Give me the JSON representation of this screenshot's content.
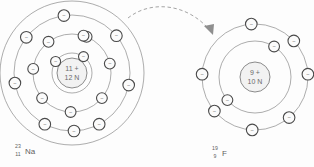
{
  "diagram": {
    "background_color": "#fdfdfd",
    "line_color": "#8a8a8a",
    "electron_stroke_color": "#4a4a4a",
    "text_color": "#5f5f5f"
  },
  "atoms": [
    {
      "id": "sodium",
      "element_symbol": "Na",
      "element_name": "Sodium",
      "mass_number": "23",
      "atomic_number": "11",
      "nucleus_protons_label": "11 +",
      "nucleus_neutrons_label": "12 N",
      "center": {
        "x": 72,
        "y": 73
      },
      "shell_radii": [
        20,
        39,
        58,
        72
      ],
      "shell_electron_counts": [
        2,
        8,
        1
      ],
      "electron_symbol": "–",
      "electrons": [
        {
          "shell": 1,
          "angle": -55,
          "radius": 20
        },
        {
          "shell": 1,
          "angle": 145,
          "radius": 20
        },
        {
          "shell": 2,
          "angle": -68,
          "radius": 39
        },
        {
          "shell": 2,
          "angle": -14,
          "radius": 39
        },
        {
          "shell": 2,
          "angle": 40,
          "radius": 39
        },
        {
          "shell": 2,
          "angle": 92,
          "radius": 39
        },
        {
          "shell": 2,
          "angle": 140,
          "radius": 39
        },
        {
          "shell": 2,
          "angle": 186,
          "radius": 39
        },
        {
          "shell": 2,
          "angle": 233,
          "radius": 39
        },
        {
          "shell": 2,
          "angle": 287,
          "radius": 39
        },
        {
          "shell": 3,
          "angle": -98,
          "radius": 58
        },
        {
          "shell": 3,
          "angle": -40,
          "radius": 58
        },
        {
          "shell": 3,
          "angle": 12,
          "radius": 58
        },
        {
          "shell": 3,
          "angle": 62,
          "radius": 58
        },
        {
          "shell": 3,
          "angle": 118,
          "radius": 58
        },
        {
          "shell": 3,
          "angle": 170,
          "radius": 58
        },
        {
          "shell": 3,
          "angle": 218,
          "radius": 58
        },
        {
          "shell": 3,
          "angle": 268,
          "radius": 58
        }
      ],
      "label_position": {
        "x": 12,
        "y": 152
      }
    },
    {
      "id": "fluorine",
      "element_symbol": "F",
      "element_name": "Fluorine",
      "mass_number": "19",
      "atomic_number": "9",
      "nucleus_protons_label": "9 +",
      "nucleus_neutrons_label": "10 N",
      "center": {
        "x": 255,
        "y": 77
      },
      "shell_radii": [
        18,
        36,
        53
      ],
      "shell_electron_counts": [
        2,
        7
      ],
      "electron_symbol": "–",
      "electrons": [
        {
          "shell": 1,
          "angle": -58,
          "radius": 36
        },
        {
          "shell": 1,
          "angle": 140,
          "radius": 36
        },
        {
          "shell": 2,
          "angle": -94,
          "radius": 53
        },
        {
          "shell": 2,
          "angle": -43,
          "radius": 53
        },
        {
          "shell": 2,
          "angle": 3,
          "radius": 53
        },
        {
          "shell": 2,
          "angle": 50,
          "radius": 53
        },
        {
          "shell": 2,
          "angle": 93,
          "radius": 53
        },
        {
          "shell": 2,
          "angle": 140,
          "radius": 53
        },
        {
          "shell": 2,
          "angle": 183,
          "radius": 53
        }
      ],
      "label_position": {
        "x": 209,
        "y": 154
      }
    }
  ],
  "transfer": {
    "type": "dashed-curved-arrow",
    "description": "electron transferred from sodium outer shell to fluorine",
    "path": "M 128 18 C 152 0 190 6 210 32",
    "arrow_head_points": "210,34 203,24 213,23"
  }
}
